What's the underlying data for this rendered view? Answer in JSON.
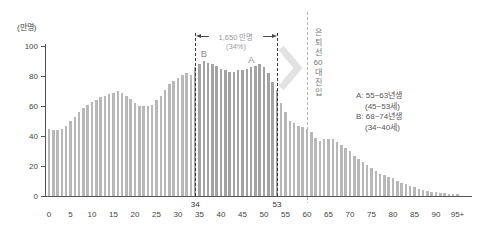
{
  "chart_data": {
    "type": "bar",
    "unit_label": "(만명)",
    "x_start": 0,
    "x_step": 1,
    "values": [
      45,
      44,
      44,
      45,
      47,
      50,
      53,
      56,
      59,
      61,
      63,
      64,
      66,
      67,
      68,
      69,
      70,
      69,
      67,
      65,
      62,
      60,
      60,
      60,
      61,
      64,
      67,
      71,
      75,
      77,
      79,
      81,
      82,
      81,
      86,
      88,
      90,
      89,
      88,
      87,
      85,
      84,
      83,
      83,
      84,
      84,
      85,
      86,
      87,
      88,
      86,
      82,
      76,
      71,
      62,
      56,
      50,
      49,
      47,
      46,
      45,
      43,
      39,
      37,
      38,
      38,
      38,
      36,
      34,
      32,
      30,
      27,
      25,
      23,
      21,
      19,
      17,
      15,
      14,
      13,
      12,
      10,
      9,
      8,
      7,
      6,
      5,
      4,
      3.5,
      3,
      2.5,
      2,
      2,
      1.5,
      1.5,
      1.5
    ],
    "xticks": [
      "0",
      "5",
      "10",
      "15",
      "20",
      "25",
      "30",
      "35",
      "40",
      "45",
      "50",
      "55",
      "60",
      "65",
      "70",
      "75",
      "80",
      "85",
      "90",
      "95+"
    ],
    "yticks": [
      "0",
      "20",
      "40",
      "60",
      "80",
      "100"
    ],
    "ylim": [
      0,
      100
    ],
    "grid": false,
    "highlight_range": {
      "from": 34,
      "to": 53,
      "from_label": "34",
      "to_label": "53",
      "annotation_text": "1,650 만명",
      "annotation_sub": "(34%)"
    },
    "cohort_markers": [
      {
        "label": "B",
        "age": 36
      },
      {
        "label": "A",
        "age": 47
      }
    ],
    "retirement_line": {
      "age": 60,
      "chars": [
        "은",
        "퇴",
        "선",
        "60",
        "대",
        "진",
        "입"
      ]
    },
    "legend_lines": [
      "A: 55~63년생",
      "(45~53세)",
      "B: 68~74년생",
      "(34~40세)"
    ],
    "colors": {
      "bar": "#b8b8b8",
      "bar_highlight": "#a3a3a3",
      "axis": "#555555",
      "bracket_line": "#3a3a3a",
      "retirement_line": "#b5b5b5",
      "annotation_text": "#999999",
      "cohort_label": "#8f8f8f",
      "legend_text": "#555555",
      "vertical_text": "#777777",
      "tick_text": "#444444",
      "chevron": "#e2e2e2"
    }
  }
}
